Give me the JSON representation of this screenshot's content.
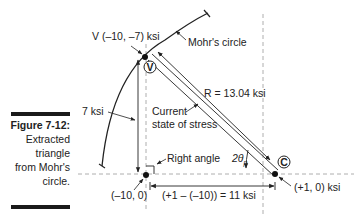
{
  "figure": {
    "number": "Figure 7-12:",
    "caption_lines": [
      "Extracted",
      "triangle",
      "from Mohr's",
      "circle."
    ]
  },
  "diagram": {
    "point_v_label": "V (–10, –7) ksi",
    "point_v_marker": "V",
    "mohrs_circle_label": "Mohr's circle",
    "radius_label": "R = 13.04 ksi",
    "vertical_leg_label": "7 ksi",
    "current_state_line1": "Current",
    "current_state_line2": "state of stress",
    "right_angle_label": "Right angle",
    "angle_label": "2θ",
    "angle_subscript": "p",
    "point_base_label": "(–10, 0)",
    "horizontal_leg_label": "(+1 – (–10)) = 11 ksi",
    "point_c_marker": "C",
    "point_c_label": "(+1, 0) ksi"
  }
}
